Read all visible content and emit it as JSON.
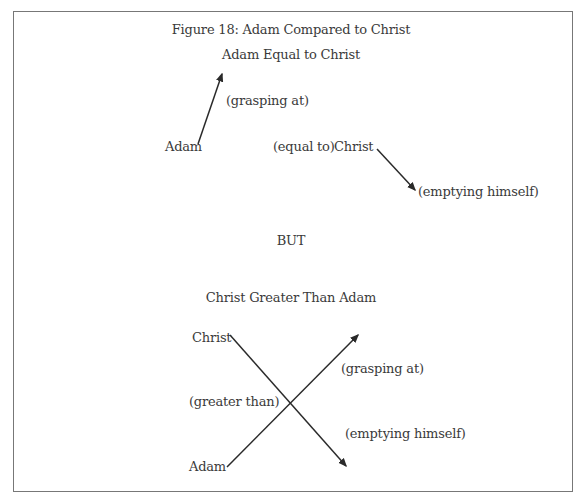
{
  "figure": {
    "title": "Figure 18: Adam Compared to Christ",
    "section1": {
      "heading": "Adam Equal to Christ",
      "nodes": {
        "adam": "Adam",
        "christ": "Christ"
      },
      "labels": {
        "grasping": "(grasping at)",
        "equal": "(equal to)",
        "emptying": "(emptying himself)"
      }
    },
    "divider": "BUT",
    "section2": {
      "heading": "Christ Greater Than Adam",
      "nodes": {
        "christ": "Christ",
        "adam": "Adam"
      },
      "labels": {
        "grasping": "(grasping at)",
        "greater": "(greater than)",
        "emptying": "(emptying himself)"
      }
    },
    "colors": {
      "text": "#3a3a3a",
      "line": "#2a2a2a",
      "border": "#777777"
    }
  }
}
